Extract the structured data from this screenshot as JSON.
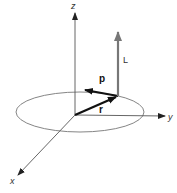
{
  "diagram": {
    "axes": {
      "z_label": "z",
      "y_label": "y",
      "x_label": "x"
    },
    "vectors": {
      "r_label": "r",
      "p_label": "p",
      "L_label": "L"
    },
    "colors": {
      "axis": "#444444",
      "orbit": "#777777",
      "r_vector": "#111111",
      "p_vector": "#111111",
      "L_vector": "#777777"
    }
  }
}
